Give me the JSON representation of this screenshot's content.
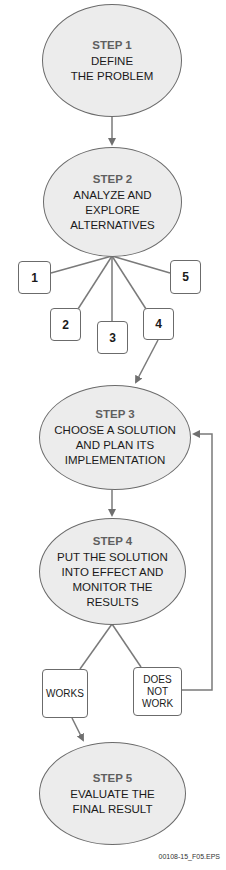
{
  "steps": [
    {
      "label": "STEP 1",
      "text": "DEFINE\nTHE PROBLEM"
    },
    {
      "label": "STEP 2",
      "text": "ANALYZE AND\nEXPLORE\nALTERNATIVES"
    },
    {
      "label": "STEP 3",
      "text": "CHOOSE A SOLUTION\nAND PLAN ITS\nIMPLEMENTATION"
    },
    {
      "label": "STEP 4",
      "text": "PUT THE SOLUTION\nINTO EFFECT AND\nMONITOR THE\nRESULTS"
    },
    {
      "label": "STEP 5",
      "text": "EVALUATE THE\nFINAL RESULT"
    }
  ],
  "alternatives": [
    "1",
    "2",
    "3",
    "4",
    "5"
  ],
  "outcomes": {
    "works": "WORKS",
    "does_not_work": "DOES\nNOT\nWORK"
  },
  "file_id": "00108-15_F05.EPS",
  "colors": {
    "ellipse_fill": "#ececec",
    "line": "#777777",
    "step_label": "#5f5f5f",
    "text": "#1a1a1a"
  }
}
